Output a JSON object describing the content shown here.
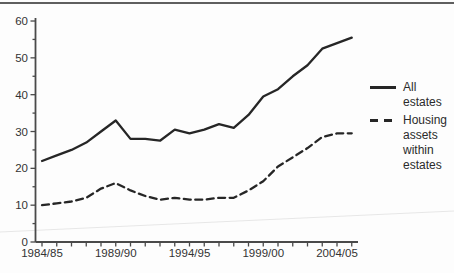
{
  "page": {
    "top_rule_color": "#5f5f5f",
    "background": "#fdfdfd"
  },
  "legend": {
    "items": [
      {
        "label": "All estates",
        "line": "solid"
      },
      {
        "label": "Housing assets within estates",
        "line": "dashed"
      }
    ]
  },
  "chart_data": {
    "type": "line",
    "title": "",
    "xlabel": "",
    "ylabel": "",
    "categories": [
      "1984/85",
      "1985/86",
      "1986/87",
      "1987/88",
      "1988/89",
      "1989/90",
      "1990/91",
      "1991/92",
      "1992/93",
      "1993/94",
      "1994/95",
      "1995/96",
      "1996/97",
      "1997/98",
      "1998/99",
      "1999/00",
      "2000/01",
      "2001/02",
      "2002/03",
      "2003/04",
      "2004/05",
      "2005/06"
    ],
    "x_tick_labels": [
      "1984/85",
      "1989/90",
      "1994/95",
      "1999/00",
      "2004/05"
    ],
    "x_tick_indices": [
      0,
      5,
      10,
      15,
      20
    ],
    "series": [
      {
        "name": "All estates",
        "style": "solid",
        "values": [
          22,
          23.5,
          25,
          27,
          30,
          33,
          28,
          28,
          27.5,
          30.5,
          29.5,
          30.5,
          32,
          31,
          34.5,
          39.5,
          41.5,
          45,
          48,
          52.5,
          54,
          55.5
        ]
      },
      {
        "name": "Housing assets within estates",
        "style": "dashed",
        "values": [
          10,
          10.5,
          11,
          12,
          14.5,
          16,
          14,
          12.5,
          11.5,
          12,
          11.5,
          11.5,
          12,
          12,
          14,
          16.5,
          20.5,
          23,
          25.5,
          28.5,
          29.5,
          29.5
        ]
      }
    ],
    "ylim": [
      0,
      60
    ],
    "y_tick_step": 10,
    "y_minor_tick_step": 5,
    "y_tick_labels": [
      "0",
      "10",
      "20",
      "30",
      "40",
      "50",
      "60"
    ],
    "grid": "off",
    "legend_position": "right",
    "line_color": "#262626",
    "axis_color": "#4a4a4a",
    "label_color": "#333333"
  }
}
